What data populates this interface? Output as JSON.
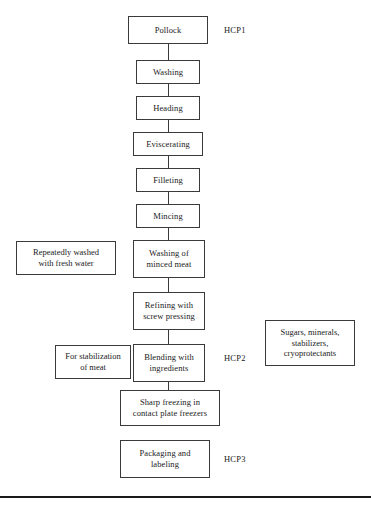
{
  "diagram": {
    "type": "flowchart",
    "orientation": "vertical",
    "line_color": "#3a3a3a",
    "background_color": "#ffffff"
  },
  "process_steps": [
    {
      "id": "pollock",
      "label": "Pollock",
      "x": 128,
      "y": 16,
      "w": 80,
      "h": 28
    },
    {
      "id": "washing",
      "label": "Washing",
      "x": 136,
      "y": 60,
      "w": 64,
      "h": 24
    },
    {
      "id": "heading",
      "label": "Heading",
      "x": 136,
      "y": 96,
      "w": 64,
      "h": 24
    },
    {
      "id": "eviscerating",
      "label": "Eviscerating",
      "x": 133,
      "y": 132,
      "w": 70,
      "h": 24
    },
    {
      "id": "filleting",
      "label": "Filleting",
      "x": 136,
      "y": 168,
      "w": 64,
      "h": 24
    },
    {
      "id": "mincing",
      "label": "Mincing",
      "x": 136,
      "y": 204,
      "w": 64,
      "h": 24
    },
    {
      "id": "washing-minced-meat",
      "label": "Washing of\nminced meat",
      "x": 133,
      "y": 240,
      "w": 72,
      "h": 38
    },
    {
      "id": "refining",
      "label": "Refining with\nscrew pressing",
      "x": 133,
      "y": 292,
      "w": 72,
      "h": 38
    },
    {
      "id": "blending",
      "label": "Blending with\ningredients",
      "x": 133,
      "y": 344,
      "w": 72,
      "h": 38
    },
    {
      "id": "sharp-freezing",
      "label": "Sharp freezing in\ncontact plate freezers",
      "x": 120,
      "y": 390,
      "w": 100,
      "h": 36
    },
    {
      "id": "packaging",
      "label": "Packaging and\nlabeling",
      "x": 120,
      "y": 440,
      "w": 90,
      "h": 38
    }
  ],
  "side_notes": [
    {
      "id": "repeatedly-washed",
      "label": "Repeatedly washed\nwith fresh water",
      "x": 16,
      "y": 241,
      "w": 100,
      "h": 34
    },
    {
      "id": "for-stabilization",
      "label": "For stabilization\nof meat",
      "x": 55,
      "y": 345,
      "w": 76,
      "h": 34
    },
    {
      "id": "ingredients-list",
      "label": "Sugars, minerals,\nstabilizers,\ncryoprotectants",
      "x": 265,
      "y": 320,
      "w": 90,
      "h": 46
    }
  ],
  "hcp_labels": [
    {
      "id": "hcp1",
      "label": "HCP1",
      "x": 224,
      "y": 26
    },
    {
      "id": "hcp2",
      "label": "HCP2",
      "x": 224,
      "y": 354
    },
    {
      "id": "hcp3",
      "label": "HCP3",
      "x": 224,
      "y": 455
    }
  ],
  "connectors": [
    {
      "id": "pollock-washing",
      "x": 168,
      "y": 44,
      "h": 16
    },
    {
      "id": "washing-heading",
      "x": 168,
      "y": 84,
      "h": 12
    },
    {
      "id": "heading-eviscerating",
      "x": 168,
      "y": 120,
      "h": 12
    },
    {
      "id": "eviscerating-filleting",
      "x": 168,
      "y": 156,
      "h": 12
    },
    {
      "id": "filleting-mincing",
      "x": 168,
      "y": 192,
      "h": 12
    },
    {
      "id": "mincing-washing-minced",
      "x": 168,
      "y": 228,
      "h": 12
    },
    {
      "id": "washing-minced-refining",
      "x": 168,
      "y": 278,
      "h": 14
    },
    {
      "id": "refining-blending",
      "x": 168,
      "y": 330,
      "h": 14
    },
    {
      "id": "blending-sharp-freezing",
      "x": 168,
      "y": 382,
      "h": 8
    }
  ],
  "page_rule": {
    "id": "bottom-rule",
    "y": 496
  }
}
